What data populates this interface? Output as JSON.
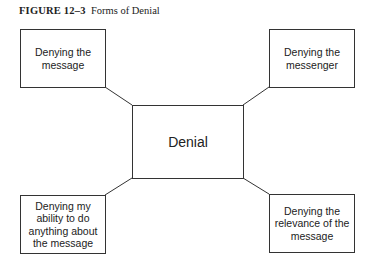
{
  "figure": {
    "label": "FIGURE 12–3",
    "title": "Forms of Denial"
  },
  "diagram": {
    "center": "Denial",
    "nodes": [
      {
        "id": "top-left",
        "text": "Denying the message"
      },
      {
        "id": "top-right",
        "text": "Denying the messenger"
      },
      {
        "id": "bottom-left",
        "text": "Denying my ability to do anything about the message"
      },
      {
        "id": "bottom-right",
        "text": "Denying the relevance of the message"
      }
    ]
  }
}
